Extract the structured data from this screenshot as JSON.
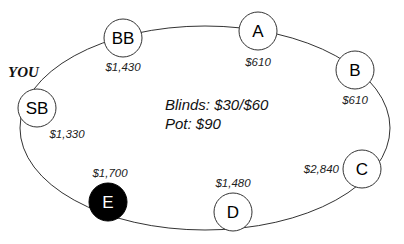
{
  "table": {
    "blinds_label": "Blinds: $30/$60",
    "pot_label": "Pot: $90",
    "hero_label": "YOU"
  },
  "seats": [
    {
      "id": "BB",
      "label": "BB",
      "stack": "$1,430",
      "highlighted": false
    },
    {
      "id": "A",
      "label": "A",
      "stack": "$610",
      "highlighted": false
    },
    {
      "id": "B",
      "label": "B",
      "stack": "$610",
      "highlighted": false
    },
    {
      "id": "C",
      "label": "C",
      "stack": "$2,840",
      "highlighted": false
    },
    {
      "id": "D",
      "label": "D",
      "stack": "$1,480",
      "highlighted": false
    },
    {
      "id": "E",
      "label": "E",
      "stack": "$1,700",
      "highlighted": true
    },
    {
      "id": "SB",
      "label": "SB",
      "stack": "$1,330",
      "highlighted": false,
      "hero": true
    }
  ],
  "colors": {
    "line": "#333333",
    "seat_fill": "#ffffff",
    "highlight_fill": "#000000",
    "highlight_text": "#ffffff"
  }
}
